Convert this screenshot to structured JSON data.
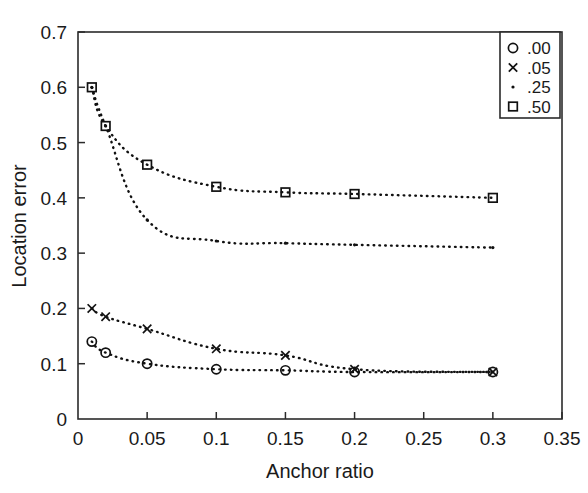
{
  "chart_data": {
    "type": "line",
    "title": "",
    "subtitle": "",
    "xlabel": "Anchor ratio",
    "ylabel": "Location error",
    "xlim": [
      0,
      0.35
    ],
    "ylim": [
      0,
      0.7
    ],
    "xticks": [
      0,
      0.05,
      0.1,
      0.15,
      0.2,
      0.25,
      0.3,
      0.35
    ],
    "xtick_labels": [
      "0",
      "0.05",
      "0.1",
      "0.15",
      "0.2",
      "0.25",
      "0.3",
      "0.35"
    ],
    "yticks": [
      0,
      0.1,
      0.2,
      0.3,
      0.4,
      0.5,
      0.6,
      0.7
    ],
    "ytick_labels": [
      "0",
      "0.1",
      "0.2",
      "0.3",
      "0.4",
      "0.5",
      "0.6",
      "0.7"
    ],
    "grid": false,
    "linestyle": "dotted",
    "legend_position": "top-right",
    "legend_entries": [
      {
        "label": ".00",
        "marker": "circle"
      },
      {
        "label": ".05",
        "marker": "cross"
      },
      {
        "label": ".25",
        "marker": "dot"
      },
      {
        "label": ".50",
        "marker": "square"
      }
    ],
    "series": [
      {
        "name": ".00",
        "marker": "circle",
        "x": [
          0.01,
          0.02,
          0.05,
          0.1,
          0.15,
          0.2,
          0.3
        ],
        "values": [
          0.14,
          0.12,
          0.1,
          0.09,
          0.088,
          0.085,
          0.085
        ]
      },
      {
        "name": ".05",
        "marker": "cross",
        "x": [
          0.01,
          0.02,
          0.05,
          0.1,
          0.15,
          0.2,
          0.3
        ],
        "values": [
          0.2,
          0.185,
          0.163,
          0.127,
          0.115,
          0.09,
          0.085
        ]
      },
      {
        "name": ".25",
        "marker": "dot",
        "x": [
          0.01,
          0.02,
          0.05,
          0.1,
          0.15,
          0.2,
          0.3
        ],
        "values": [
          0.6,
          0.53,
          0.36,
          0.322,
          0.318,
          0.315,
          0.31
        ]
      },
      {
        "name": ".50",
        "marker": "square",
        "x": [
          0.01,
          0.02,
          0.05,
          0.1,
          0.15,
          0.2,
          0.3
        ],
        "values": [
          0.6,
          0.53,
          0.46,
          0.42,
          0.41,
          0.407,
          0.4
        ]
      }
    ]
  },
  "axes": {
    "x_title": "Anchor ratio",
    "y_title": "Location error"
  }
}
